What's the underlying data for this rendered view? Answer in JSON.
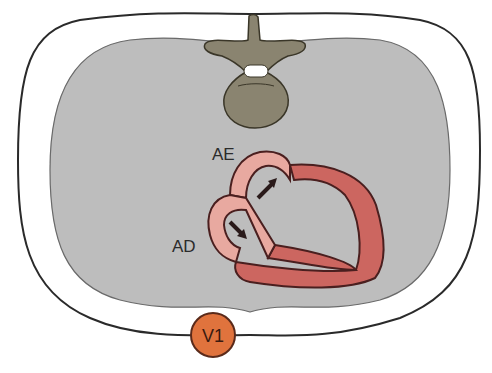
{
  "diagram": {
    "labels": {
      "left_atrium": "AE",
      "right_atrium": "AD",
      "electrode": "V1"
    },
    "colors": {
      "background": "#ffffff",
      "thorax_outline": "#2a2a2a",
      "lung_cavity": "#bdbdbd",
      "vertebra": "#8a8470",
      "atria": "#e8a9a0",
      "ventricles": "#cc6660",
      "heart_outline": "#4a1f1f",
      "electrode_fill": "#e0733d",
      "arrow": "#2a1a1a"
    },
    "arrows": [
      {
        "name": "left-atrium-depolarization-arrow",
        "direction": "up-right"
      },
      {
        "name": "right-atrium-depolarization-arrow",
        "direction": "down-right"
      }
    ]
  }
}
